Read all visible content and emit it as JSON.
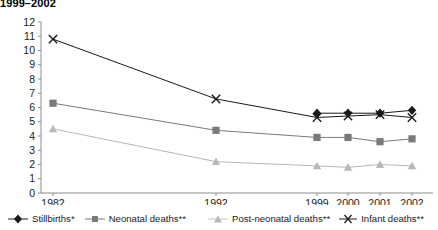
{
  "title": "1999–2002",
  "chart_data": {
    "type": "line",
    "title": "1999–2002",
    "xlabel": "",
    "ylabel": "",
    "x": [
      "1982",
      "1992",
      "1999",
      "2000",
      "2001",
      "2002"
    ],
    "categories": [
      "1982",
      "1992",
      "1999",
      "2000",
      "2001",
      "2002"
    ],
    "ylim": [
      0,
      12
    ],
    "yticks": [
      0,
      1,
      2,
      3,
      4,
      5,
      6,
      7,
      8,
      9,
      10,
      11,
      12
    ],
    "ytick_labels": [
      "0",
      "1",
      "2",
      "3",
      "4",
      "5",
      "6",
      "7",
      "8",
      "9",
      "10",
      "11",
      "12"
    ],
    "grid": false,
    "legend_position": "bottom",
    "series": [
      {
        "name": "Stillbirths*",
        "marker": "diamond",
        "color": "#1a1a1a",
        "values": [
          null,
          null,
          5.6,
          5.6,
          5.6,
          5.8
        ]
      },
      {
        "name": "Neonatal deaths**",
        "marker": "square",
        "color": "#7a7a7a",
        "values": [
          6.3,
          4.4,
          3.9,
          3.9,
          3.6,
          3.8
        ]
      },
      {
        "name": "Post-neonatal deaths**",
        "marker": "triangle",
        "color": "#b8b8b8",
        "values": [
          4.5,
          2.2,
          1.9,
          1.8,
          2.0,
          1.9
        ]
      },
      {
        "name": "Infant deaths**",
        "marker": "x",
        "color": "#1a1a1a",
        "values": [
          10.8,
          6.6,
          5.3,
          5.4,
          5.5,
          5.3
        ]
      }
    ]
  },
  "legend": {
    "items": [
      {
        "label": "Stillbirths*",
        "marker": "diamond-marker-icon"
      },
      {
        "label": "Neonatal deaths**",
        "marker": "square-marker-icon"
      },
      {
        "label": "Post-neonatal deaths**",
        "marker": "triangle-marker-icon"
      },
      {
        "label": "Infant deaths**",
        "marker": "x-marker-icon"
      }
    ]
  }
}
